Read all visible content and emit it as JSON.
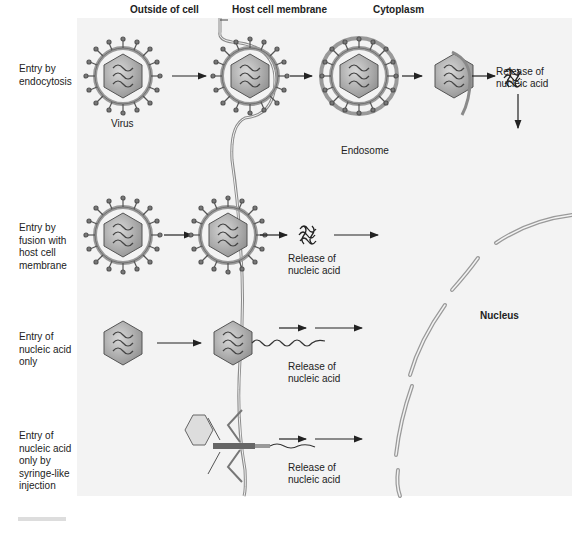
{
  "diagram": {
    "column_headers": {
      "outside": "Outside of cell",
      "membrane": "Host cell membrane",
      "cytoplasm": "Cytoplasm"
    },
    "rows": [
      {
        "label": "Entry by endocytosis",
        "lines": [
          "Entry by",
          "endocytosis"
        ]
      },
      {
        "label": "Entry by fusion with host cell membrane",
        "lines": [
          "Entry by",
          "fusion with",
          "host cell",
          "membrane"
        ]
      },
      {
        "label": "Entry of nucleic acid only",
        "lines": [
          "Entry of",
          "nucleic acid",
          "only"
        ]
      },
      {
        "label": "Entry of nucleic acid only by syringe-like injection",
        "lines": [
          "Entry of",
          "nucleic acid",
          "only by",
          "syringe-like",
          "injection"
        ]
      }
    ],
    "annotations": {
      "virus": "Virus",
      "endosome": "Endosome",
      "release_1": [
        "Release of",
        "nucleic acid"
      ],
      "release_2": [
        "Release of",
        "nucleic acid"
      ],
      "release_3": [
        "Release of",
        "nucleic acid"
      ],
      "release_4": [
        "Release of",
        "nucleic acid"
      ],
      "nucleus": "Nucleus"
    },
    "colors": {
      "panel_bg": "#f3f3f3",
      "line": "#333333",
      "virus_fill": "#b9b9b9",
      "membrane": "#8a8a8a"
    }
  }
}
